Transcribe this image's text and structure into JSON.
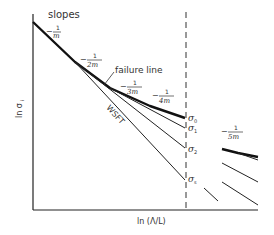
{
  "diagram": {
    "title": "slopes",
    "axes": {
      "y_label": "ln σ",
      "y_label_sub": "i",
      "x_label": "ln (Λ/L)"
    },
    "slope_labels": [
      {
        "prefix": "−",
        "num": "1",
        "den": "m"
      },
      {
        "prefix": "−",
        "num": "1",
        "den": "2m"
      },
      {
        "prefix": "−",
        "num": "1",
        "den": "3m"
      },
      {
        "prefix": "−",
        "num": "1",
        "den": "4m"
      },
      {
        "prefix": "−",
        "num": "1",
        "den": "5m"
      }
    ],
    "annotations": {
      "failure_line": "failure line",
      "wsft": "WSFT"
    },
    "stress_levels": [
      {
        "symbol": "σ",
        "sub": "0"
      },
      {
        "symbol": "σ",
        "sub": "1"
      },
      {
        "symbol": "σ",
        "sub": "2"
      },
      {
        "symbol": "σ",
        "sub": "s"
      }
    ],
    "colors": {
      "line": "#222222",
      "text": "#333333",
      "background": "#ffffff"
    }
  }
}
